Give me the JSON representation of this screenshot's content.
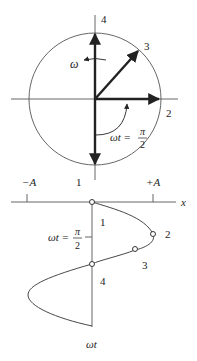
{
  "diagram": {
    "type": "phasor-to-sinusoid",
    "colors": {
      "line": "#2a2a2a",
      "thin": "#555555",
      "background": "#ffffff"
    },
    "phasor": {
      "omega_label": "ω",
      "vector_labels": {
        "v1": "1",
        "v2": "2",
        "v3": "3",
        "v4": "4"
      },
      "angle_label": {
        "lhs": "ωt =",
        "numerator": "π",
        "denominator": "2"
      }
    },
    "projection": {
      "axis_label": "x",
      "time_axis_label": "ωt",
      "amplitude_labels": {
        "negative": "−A",
        "positive": "+A"
      },
      "point_labels": {
        "p1": "1",
        "p2": "2",
        "p3": "3",
        "p4": "4"
      },
      "angle_label": {
        "lhs": "ωt =",
        "numerator": "π",
        "denominator": "2"
      }
    }
  }
}
